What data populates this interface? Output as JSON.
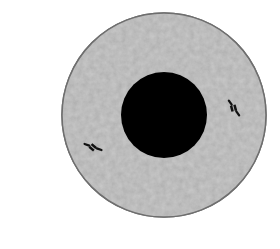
{
  "diagram": {
    "type": "cell-illustration",
    "canvas": {
      "width": 280,
      "height": 249,
      "background": "#ffffff"
    },
    "cell": {
      "cx": 164,
      "cy": 115,
      "r": 102,
      "fill": "#c9c9c9",
      "stroke": "#6e6e6e",
      "texture": "mottled-gray"
    },
    "nucleus": {
      "cx": 164,
      "cy": 115,
      "r": 43,
      "fill": "#000000"
    },
    "centrioles": [
      {
        "name": "centriole-right",
        "x": 234,
        "y": 108,
        "angle": 55
      },
      {
        "name": "centriole-left",
        "x": 93,
        "y": 147,
        "angle": 20
      }
    ]
  }
}
